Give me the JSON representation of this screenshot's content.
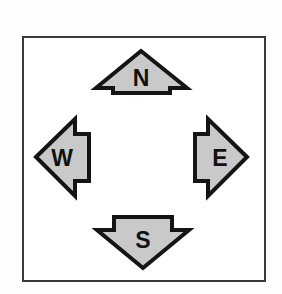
{
  "figure": {
    "name": "compass-rose-diagram",
    "title": "",
    "frame": {
      "border_color": "#3a3a3a",
      "background_color": "#ffffff"
    },
    "style": {
      "arrow_fill": "#c9c9c9",
      "arrow_outline": "#141414",
      "label_color": "#111111"
    },
    "arrows": [
      {
        "id": "north",
        "label": "N",
        "direction": "up",
        "points": "141,51 187,88 170,88 170,93 113,93 113,88 96,88",
        "label_x": 141.5,
        "label_y": 78
      },
      {
        "id": "west",
        "label": "W",
        "direction": "left",
        "points": "36,157 75,119 75,134 89,134 89,181 75,181 75,196"
      },
      {
        "id": "east",
        "label": "E",
        "direction": "right",
        "points": "247,157 208,119 208,134 195,134 195,181 208,181 208,196"
      },
      {
        "id": "south",
        "label": "S",
        "direction": "down",
        "points": "143,268 97,230 114,230 114,217 172,217 172,230 189,230"
      }
    ],
    "label_positions": {
      "north": {
        "x": 141,
        "y": 77
      },
      "west": {
        "x": 62,
        "y": 157
      },
      "east": {
        "x": 220,
        "y": 157
      },
      "south": {
        "x": 143,
        "y": 240
      }
    }
  }
}
